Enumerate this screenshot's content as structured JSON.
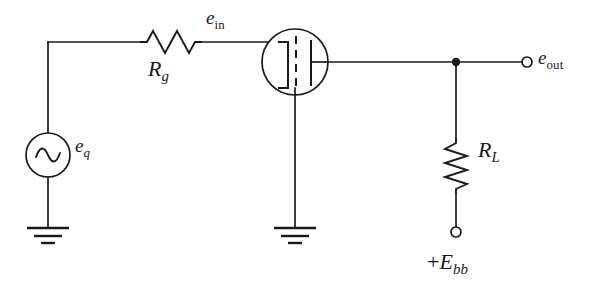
{
  "diagram": {
    "type": "schematic",
    "background_color": "#ffffff",
    "line_color": "#1a1a1a",
    "width": 590,
    "height": 293
  },
  "labels": {
    "e_in": {
      "symbol": "e",
      "subscript": "in",
      "subscript_style": "upright",
      "text": "e"
    },
    "R_g": {
      "symbol": "R",
      "subscript": "g",
      "subscript_style": "italic",
      "text": "R"
    },
    "e_q": {
      "symbol": "e",
      "subscript": "q",
      "subscript_style": "italic",
      "text": "e"
    },
    "e_out": {
      "symbol": "e",
      "subscript": "out",
      "subscript_style": "upright",
      "text": "e"
    },
    "R_L": {
      "symbol": "R",
      "subscript": "L",
      "subscript_style": "italic",
      "text": "R"
    },
    "E_bb": {
      "prefix": "+",
      "symbol": "E",
      "subscript": "bb",
      "subscript_style": "italic",
      "text": "E"
    }
  },
  "components": [
    {
      "id": "source-eq",
      "name": "ac-voltage-source",
      "label": "e_q",
      "symbol": "circle-with-sine",
      "center": [
        48,
        155
      ],
      "radius": 22
    },
    {
      "id": "resistor-rg",
      "name": "grid-resistor",
      "label": "R_g",
      "symbol": "zigzag-horizontal",
      "orientation": "horizontal",
      "peaks": 3,
      "span": [
        140,
        200
      ],
      "axis_y": 42
    },
    {
      "id": "tube-v1",
      "name": "vacuum-tube-triode",
      "symbol": "circle-with-electrodes",
      "center": [
        295,
        62
      ],
      "radius": 33,
      "electrodes": [
        "cathode-bracket",
        "grid-dashed",
        "plate-bar"
      ]
    },
    {
      "id": "resistor-rl",
      "name": "load-resistor",
      "label": "R_L",
      "symbol": "zigzag-vertical",
      "orientation": "vertical",
      "peaks": 4,
      "span": [
        138,
        192
      ],
      "axis_x": 456
    }
  ],
  "terminals": [
    {
      "id": "terminal-eout",
      "name": "output-terminal",
      "label": "e_out",
      "style": "open-circle",
      "position": [
        527,
        62
      ],
      "radius": 5
    },
    {
      "id": "terminal-ebb",
      "name": "supply-terminal",
      "label": "+E_bb",
      "style": "open-circle",
      "position": [
        456,
        232
      ],
      "radius": 5
    }
  ],
  "grounds": [
    {
      "id": "ground-source",
      "name": "ground-symbol-left",
      "position": [
        48,
        228
      ],
      "bars": 3
    },
    {
      "id": "ground-cathode",
      "name": "ground-symbol-center",
      "position": [
        295,
        228
      ],
      "bars": 3
    }
  ],
  "junctions": [
    {
      "id": "node-plate",
      "name": "plate-output-node",
      "position": [
        456,
        62
      ],
      "radius": 4
    }
  ],
  "nets": [
    {
      "id": "net-grid-input",
      "name": "grid-input-net",
      "from": "source-eq",
      "to": "tube-v1.grid"
    },
    {
      "id": "net-source-gnd",
      "name": "source-ground-net",
      "from": "source-eq",
      "to": "ground-source"
    },
    {
      "id": "net-cathode-gnd",
      "name": "cathode-ground-net",
      "from": "tube-v1.cathode",
      "to": "ground-cathode"
    },
    {
      "id": "net-plate-out",
      "name": "plate-output-net",
      "from": "tube-v1.plate",
      "to": "terminal-eout"
    },
    {
      "id": "net-load-supply",
      "name": "load-supply-net",
      "from": "node-plate",
      "to": "terminal-ebb"
    }
  ]
}
